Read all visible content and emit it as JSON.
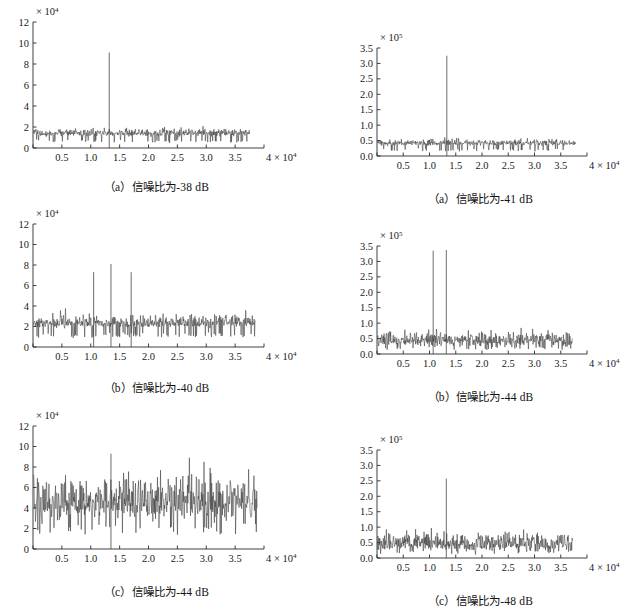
{
  "figure": {
    "background": "#ffffff",
    "trace_color": "#3b3b3b",
    "axis_color": "#2a2a2a",
    "columns": 2,
    "rows": 3
  },
  "panels": [
    {
      "id": "panel-a-left",
      "caption": "（a）信噪比为-38 dB",
      "position": "top-left"
    },
    {
      "id": "panel-a-right",
      "caption": "（a）信噪比为-41 dB",
      "position": "top-right"
    },
    {
      "id": "panel-b-left",
      "caption": "（b）信噪比为-40 dB",
      "position": "middle-left"
    },
    {
      "id": "panel-b-right",
      "caption": "（b）信噪比为-44 dB",
      "position": "middle-right"
    },
    {
      "id": "panel-c-left",
      "caption": "（c）信噪比为-44 dB",
      "position": "bottom-left"
    },
    {
      "id": "panel-c-right",
      "caption": "（c）信噪比为-48 dB",
      "position": "bottom-right"
    }
  ],
  "chart_data": [
    {
      "type": "line",
      "id": "panel-a-left",
      "title": "（a）信噪比为-38 dB",
      "xlabel": "",
      "ylabel": "",
      "x_exponent_label": "× 10",
      "x_exponent": "4",
      "y_exponent_label": "× 10",
      "y_exponent": "4",
      "xlim": [
        0,
        40000
      ],
      "ylim": [
        0,
        120000
      ],
      "xticks": [
        0,
        5000,
        10000,
        15000,
        20000,
        25000,
        30000,
        35000,
        40000
      ],
      "xticklabels": [
        "",
        "0.5",
        "1.0",
        "1.5",
        "2.0",
        "2.5",
        "3.0",
        "3.5",
        "4 × 10"
      ],
      "yticks": [
        0,
        20000,
        40000,
        60000,
        80000,
        100000,
        120000
      ],
      "yticklabels": [
        "0",
        "2",
        "4",
        "6",
        "8",
        "10",
        "12"
      ],
      "grid": false,
      "legend": "none",
      "data_extent_x": [
        100,
        37500
      ],
      "noise_floor": 11000,
      "noise_spread": 4500,
      "peaks": [
        {
          "x": 13200,
          "y": 91000,
          "label": "signal peak"
        }
      ],
      "seed": 101
    },
    {
      "type": "line",
      "id": "panel-a-right",
      "title": "（a）信噪比为-41 dB",
      "xlabel": "",
      "ylabel": "",
      "x_exponent_label": "× 10",
      "x_exponent": "4",
      "y_exponent_label": "× 10",
      "y_exponent": "5",
      "xlim": [
        0,
        40000
      ],
      "ylim": [
        0,
        350000
      ],
      "xticks": [
        0,
        5000,
        10000,
        15000,
        20000,
        25000,
        30000,
        35000,
        40000
      ],
      "xticklabels": [
        "",
        "0.5",
        "1.0",
        "1.5",
        "2.0",
        "2.5",
        "3.0",
        "3.5",
        "4 × 10"
      ],
      "yticks": [
        0,
        50000,
        100000,
        150000,
        200000,
        250000,
        300000,
        350000
      ],
      "yticklabels": [
        "0.0",
        "0.5",
        "1.0",
        "1.5",
        "2.0",
        "2.5",
        "3.0",
        "3.5"
      ],
      "grid": false,
      "legend": "none",
      "data_extent_x": [
        100,
        37800
      ],
      "noise_floor": 33000,
      "noise_spread": 13000,
      "peaks": [
        {
          "x": 13300,
          "y": 325000,
          "label": "signal peak"
        }
      ],
      "seed": 202
    },
    {
      "type": "line",
      "id": "panel-b-left",
      "title": "（b）信噪比为-40 dB",
      "xlabel": "",
      "ylabel": "",
      "x_exponent_label": "× 10",
      "x_exponent": "4",
      "y_exponent_label": "× 10",
      "y_exponent": "4",
      "xlim": [
        0,
        40000
      ],
      "ylim": [
        0,
        120000
      ],
      "xticks": [
        0,
        5000,
        10000,
        15000,
        20000,
        25000,
        30000,
        35000,
        40000
      ],
      "xticklabels": [
        "",
        "0.5",
        "1.0",
        "1.5",
        "2.0",
        "2.5",
        "3.0",
        "3.5",
        "4 × 10"
      ],
      "yticks": [
        0,
        20000,
        40000,
        60000,
        80000,
        100000,
        120000
      ],
      "yticklabels": [
        "0",
        "2",
        "4",
        "6",
        "8",
        "10",
        "12"
      ],
      "grid": false,
      "legend": "none",
      "data_extent_x": [
        100,
        38500
      ],
      "noise_floor": 19000,
      "noise_spread": 7000,
      "peaks": [
        {
          "x": 10500,
          "y": 73000,
          "label": "sideband peak left"
        },
        {
          "x": 13500,
          "y": 81000,
          "label": "signal peak"
        },
        {
          "x": 17000,
          "y": 73000,
          "label": "sideband peak right"
        }
      ],
      "seed": 303
    },
    {
      "type": "line",
      "id": "panel-b-right",
      "title": "（b）信噪比为-44 dB",
      "xlabel": "",
      "ylabel": "",
      "x_exponent_label": "× 10",
      "x_exponent": "4",
      "y_exponent_label": "× 10",
      "y_exponent": "5",
      "xlim": [
        0,
        40000
      ],
      "ylim": [
        0,
        350000
      ],
      "xticks": [
        0,
        5000,
        10000,
        15000,
        20000,
        25000,
        30000,
        35000,
        40000
      ],
      "xticklabels": [
        "",
        "0.5",
        "1.0",
        "1.5",
        "2.0",
        "2.5",
        "3.0",
        "3.5",
        "4 × 10"
      ],
      "yticks": [
        0,
        50000,
        100000,
        150000,
        200000,
        250000,
        300000,
        350000
      ],
      "yticklabels": [
        "0.0",
        "0.5",
        "1.0",
        "1.5",
        "2.0",
        "2.5",
        "3.0",
        "3.5"
      ],
      "grid": false,
      "legend": "none",
      "data_extent_x": [
        100,
        37200
      ],
      "noise_floor": 26000,
      "noise_spread": 28000,
      "peaks": [
        {
          "x": 10700,
          "y": 335000,
          "label": "sideband peak"
        },
        {
          "x": 13200,
          "y": 337000,
          "label": "signal peak"
        }
      ],
      "seed": 404
    },
    {
      "type": "line",
      "id": "panel-c-left",
      "title": "（c）信噪比为-44 dB",
      "xlabel": "",
      "ylabel": "",
      "x_exponent_label": "× 10",
      "x_exponent": "4",
      "y_exponent_label": "× 10",
      "y_exponent": "4",
      "xlim": [
        0,
        40000
      ],
      "ylim": [
        0,
        120000
      ],
      "xticks": [
        0,
        5000,
        10000,
        15000,
        20000,
        25000,
        30000,
        35000,
        40000
      ],
      "xticklabels": [
        "",
        "0.5",
        "1.0",
        "1.5",
        "2.0",
        "2.5",
        "3.0",
        "3.5",
        "4 × 10"
      ],
      "yticks": [
        0,
        20000,
        40000,
        60000,
        80000,
        100000,
        120000
      ],
      "yticklabels": [
        "0",
        "2",
        "4",
        "6",
        "8",
        "10",
        "12"
      ],
      "grid": false,
      "legend": "none",
      "data_extent_x": [
        100,
        38800
      ],
      "noise_floor": 29000,
      "noise_spread": 26000,
      "peaks": [
        {
          "x": 13500,
          "y": 93000,
          "label": "signal peak"
        }
      ],
      "seed": 505
    },
    {
      "type": "line",
      "id": "panel-c-right",
      "title": "（c）信噪比为-48 dB",
      "xlabel": "",
      "ylabel": "",
      "x_exponent_label": "× 10",
      "x_exponent": "4",
      "y_exponent_label": "× 10",
      "y_exponent": "5",
      "xlim": [
        0,
        40000
      ],
      "ylim": [
        0,
        350000
      ],
      "xticks": [
        0,
        5000,
        10000,
        15000,
        20000,
        25000,
        30000,
        35000,
        40000
      ],
      "xticklabels": [
        "",
        "0.5",
        "1.0",
        "1.5",
        "2.0",
        "2.5",
        "3.0",
        "3.5",
        "4 × 10"
      ],
      "yticks": [
        0,
        50000,
        100000,
        150000,
        200000,
        250000,
        300000,
        350000
      ],
      "yticklabels": [
        "0.0",
        "0.5",
        "1.0",
        "1.5",
        "2.0",
        "2.5",
        "3.0",
        "3.5"
      ],
      "grid": false,
      "legend": "none",
      "data_extent_x": [
        100,
        37300
      ],
      "noise_floor": 24000,
      "noise_spread": 34000,
      "peaks": [
        {
          "x": 13200,
          "y": 257000,
          "label": "signal peak"
        }
      ],
      "seed": 606
    }
  ]
}
